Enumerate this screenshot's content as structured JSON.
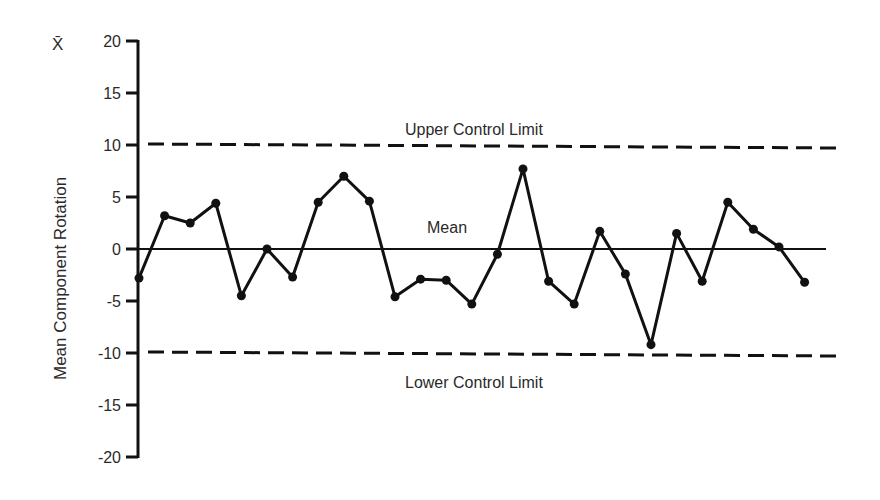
{
  "chart_data": {
    "type": "line",
    "title": "",
    "xlabel": "",
    "ylabel": "Mean Component Rotation",
    "y_symbol": "X̄",
    "ylim": [
      -20,
      20
    ],
    "yticks": [
      20,
      15,
      10,
      5,
      0,
      -5,
      -10,
      -15,
      -20
    ],
    "grid": false,
    "legend": null,
    "x": [
      1,
      2,
      3,
      4,
      5,
      6,
      7,
      8,
      9,
      10,
      11,
      12,
      13,
      14,
      15,
      16,
      17,
      18,
      19,
      20,
      21,
      22,
      23,
      24,
      25,
      26,
      27
    ],
    "series": [
      {
        "name": "Sample Mean",
        "values": [
          -2.8,
          3.2,
          2.5,
          4.4,
          -4.5,
          0.0,
          -2.7,
          4.5,
          7.0,
          4.6,
          -4.6,
          -2.9,
          -3.0,
          -5.3,
          -0.5,
          7.7,
          -3.1,
          -5.3,
          1.7,
          -2.4,
          -9.2,
          1.5,
          -3.1,
          4.5,
          1.9,
          0.2,
          -3.2
        ]
      }
    ],
    "reference_lines": [
      {
        "name": "Upper Control Limit",
        "value": 10,
        "style": "dashed"
      },
      {
        "name": "Mean",
        "value": 0,
        "style": "solid"
      },
      {
        "name": "Lower Control Limit",
        "value": -10,
        "style": "dashed"
      }
    ],
    "annotations": [
      {
        "text": "Upper Control Limit",
        "x_px": 405,
        "y_px": 135
      },
      {
        "text": "Mean",
        "x_px": 427,
        "y_px": 233
      },
      {
        "text": "Lower Control Limit",
        "x_px": 405,
        "y_px": 388
      }
    ]
  },
  "labels": {
    "ylabel": "Mean Component Rotation",
    "y_symbol": "X̄",
    "ucl": "Upper Control Limit",
    "mean": "Mean",
    "lcl": "Lower Control Limit"
  }
}
